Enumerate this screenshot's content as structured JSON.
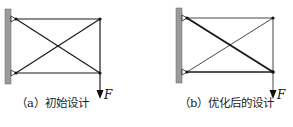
{
  "figure": {
    "panels": [
      {
        "id": "a",
        "caption": "（a）初始设计",
        "load_label": "F",
        "members": {
          "top_chord": {
            "width": 1.2
          },
          "bottom_chord": {
            "width": 1.2
          },
          "diag_top_to_bottom": {
            "width": 1.2
          },
          "diag_bottom_to_top": {
            "width": 1.2
          },
          "vertical": {
            "width": 1.2
          }
        }
      },
      {
        "id": "b",
        "caption": "（b）优化后的设计",
        "load_label": "F",
        "members": {
          "top_chord": {
            "width": 0.8
          },
          "bottom_chord": {
            "width": 1.6
          },
          "diag_top_to_bottom": {
            "width": 2.0
          },
          "diag_bottom_to_top": {
            "width": 0.8
          },
          "vertical": {
            "width": 0.8
          }
        }
      }
    ],
    "colors": {
      "wall": "#9a9a9a",
      "member": "#1a1a1a",
      "background": "#ffffff"
    }
  }
}
